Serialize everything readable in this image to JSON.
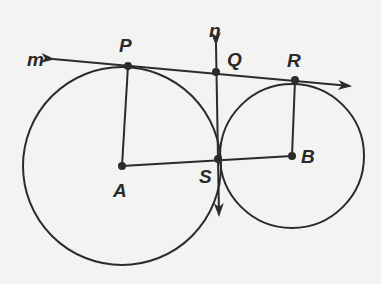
{
  "diagram": {
    "colors": {
      "ink": "#2b2b2b",
      "background": "#f3f3f1"
    },
    "circles": [
      {
        "name": "circle-A",
        "center": "A",
        "cx": 122,
        "cy": 166,
        "r": 99
      },
      {
        "name": "circle-B",
        "center": "B",
        "cx": 292,
        "cy": 156,
        "r": 72
      }
    ],
    "points": [
      {
        "id": "P",
        "label": "P",
        "x": 128,
        "y": 66,
        "lx": 119,
        "ly": 52
      },
      {
        "id": "Q",
        "label": "Q",
        "x": 216,
        "y": 72,
        "lx": 227,
        "ly": 66
      },
      {
        "id": "R",
        "label": "R",
        "x": 295,
        "y": 80,
        "lx": 287,
        "ly": 67
      },
      {
        "id": "A",
        "label": "A",
        "x": 122,
        "y": 166,
        "lx": 113,
        "ly": 197
      },
      {
        "id": "S",
        "label": "S",
        "x": 218,
        "y": 159,
        "lx": 199,
        "ly": 183
      },
      {
        "id": "B",
        "label": "B",
        "x": 292,
        "y": 156,
        "lx": 301,
        "ly": 163
      }
    ],
    "lines": [
      {
        "name": "line-m",
        "label": "m",
        "type": "line",
        "x1": 53,
        "y1": 59,
        "x2": 350,
        "y2": 86,
        "lx": 27,
        "ly": 66
      },
      {
        "name": "line-n",
        "label": "n",
        "type": "line",
        "x1": 216,
        "y1": 44,
        "x2": 219,
        "y2": 215,
        "lx": 209,
        "ly": 37
      }
    ],
    "segments": [
      {
        "name": "segment-PA",
        "from": "P",
        "to": "A"
      },
      {
        "name": "segment-RB",
        "from": "R",
        "to": "B"
      },
      {
        "name": "segment-AB",
        "from": "A",
        "to": "B"
      }
    ]
  }
}
